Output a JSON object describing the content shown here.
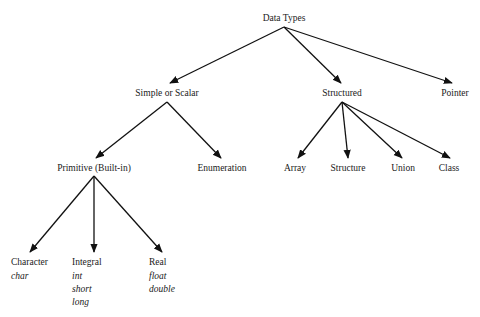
{
  "diagram": {
    "root": {
      "label": "Data Types"
    },
    "level1": [
      {
        "label": "Simple or Scalar"
      },
      {
        "label": "Structured"
      },
      {
        "label": "Pointer"
      }
    ],
    "simple_children": [
      {
        "label": "Primitive (Built-in)"
      },
      {
        "label": "Enumeration"
      }
    ],
    "structured_children": [
      {
        "label": "Array"
      },
      {
        "label": "Structure"
      },
      {
        "label": "Union"
      },
      {
        "label": "Class"
      }
    ],
    "primitive_children": [
      {
        "label": "Character",
        "keywords": [
          "char"
        ]
      },
      {
        "label": "Integral",
        "keywords": [
          "int",
          "short",
          "long"
        ]
      },
      {
        "label": "Real",
        "keywords": [
          "float",
          "double"
        ]
      }
    ]
  }
}
